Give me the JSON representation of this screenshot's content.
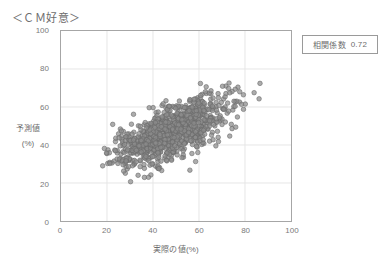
{
  "chart_data": {
    "type": "scatter",
    "title": "＜ＣＭ好意＞",
    "xlabel": "実際の値(%)",
    "ylabel_line1": "予測値",
    "ylabel_line2": "(%)",
    "xlim": [
      0,
      100
    ],
    "ylim": [
      0,
      100
    ],
    "xticks": [
      0,
      20,
      40,
      60,
      80,
      100
    ],
    "yticks": [
      0,
      20,
      40,
      60,
      80,
      100
    ],
    "xtick_labels": [
      "0",
      "20",
      "40",
      "60",
      "80",
      "100"
    ],
    "ytick_labels": [
      "0",
      "20",
      "40",
      "60",
      "80",
      "100"
    ],
    "grid": true,
    "grid_color": "#e6e6e6",
    "axis_color": "#a6a6a6",
    "legend": "none",
    "annotations": [
      {
        "name": "correlation",
        "label": "相関係数",
        "value": "0.72"
      }
    ],
    "series": [
      {
        "name": "予測値 vs 実際の値",
        "marker": "circle",
        "marker_size_px": 4.6,
        "fill_color": "#8c8c8c",
        "stroke_color": "#6a6a6a",
        "opacity": 0.72,
        "n_points": 1000,
        "correlation": 0.72,
        "x_mean": 48.0,
        "y_mean": 46.5,
        "x_std": 13.0,
        "y_std": 9.6,
        "x_range": [
          16.5,
          87.0
        ],
        "y_range": [
          20.0,
          82.0
        ]
      }
    ]
  },
  "chart": {
    "title": "＜ＣＭ好意＞",
    "correlation_box": {
      "label": "相関係数",
      "value": "0.72"
    },
    "axes": {
      "x_title": "実際の値(%)",
      "y_title_line1": "予測値",
      "y_title_line2": "(%)"
    }
  }
}
